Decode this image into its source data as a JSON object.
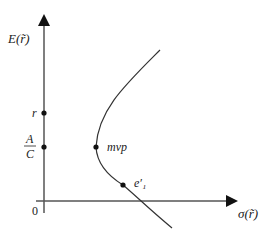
{
  "diagram": {
    "type": "mean-variance frontier",
    "y_axis_label": "E(r̃)",
    "x_axis_label": "σ(r̃)",
    "origin_label": "0",
    "y_axis_points": [
      {
        "label": "r",
        "y": 113
      },
      {
        "label_num": "A",
        "label_den": "C",
        "y": 147
      }
    ],
    "curve_points": [
      {
        "label": "mvp",
        "x": 96,
        "y": 147
      },
      {
        "label": "e′₁",
        "x": 123,
        "y": 185
      }
    ],
    "colors": {
      "axis": "#555555",
      "curve": "#333333",
      "dot": "#111111"
    }
  }
}
